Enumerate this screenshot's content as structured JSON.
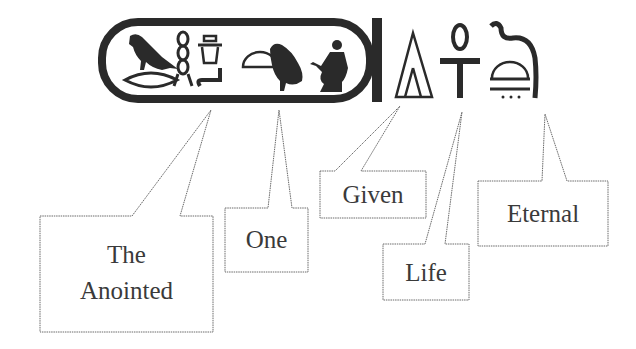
{
  "diagram": {
    "title": "",
    "colors": {
      "ink": "#2a2a2a",
      "callout_stroke": "#6a6a6a",
      "text": "#3a3a3a",
      "background": "#ffffff"
    },
    "cartouche": {
      "glyphs": [
        "vulture-bird",
        "twisted-flax",
        "jar-on-stand",
        "water-bowl",
        "bread-loaf",
        "quail-chick",
        "seated-man"
      ]
    },
    "signs_outside": [
      "triangular-cone",
      "ankh",
      "cobra-over-basket"
    ],
    "callouts": [
      {
        "id": "anointed",
        "lines": [
          "The",
          "Anointed"
        ]
      },
      {
        "id": "one",
        "lines": [
          "One"
        ]
      },
      {
        "id": "given",
        "lines": [
          "Given"
        ]
      },
      {
        "id": "life",
        "lines": [
          "Life"
        ]
      },
      {
        "id": "eternal",
        "lines": [
          "Eternal"
        ]
      }
    ]
  }
}
